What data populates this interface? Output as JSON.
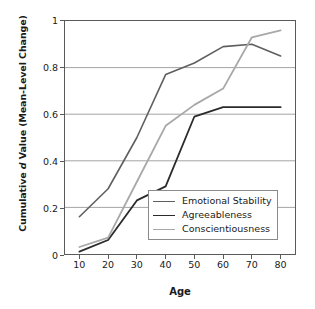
{
  "chart_data": {
    "type": "line",
    "title": "",
    "xlabel": "Age",
    "ylabel": "Cumulative d Value (Mean-Level Change)",
    "ylabel_prefix": "Cumulative ",
    "ylabel_italic": "d",
    "ylabel_suffix": " Value (Mean-Level Change)",
    "x": [
      10,
      20,
      30,
      40,
      50,
      60,
      70,
      80
    ],
    "xlim": [
      5,
      85
    ],
    "ylim": [
      0,
      1
    ],
    "xticks": [
      "10",
      "20",
      "30",
      "40",
      "50",
      "60",
      "70",
      "80"
    ],
    "yticks": [
      "0",
      "0.2",
      "0.4",
      "0.6",
      "0.8",
      "1"
    ],
    "ytick_values": [
      0,
      0.2,
      0.4,
      0.6,
      0.8,
      1
    ],
    "grid": "horizontal",
    "grid_color": "#9a9a9a",
    "legend_position": "lower right",
    "series": [
      {
        "name": "Emotional Stability",
        "color": "#5f5f5f",
        "width": 1.6,
        "values": [
          0.16,
          0.28,
          0.5,
          0.77,
          0.82,
          0.89,
          0.9,
          0.85
        ]
      },
      {
        "name": "Agreeableness",
        "color": "#2b2b2b",
        "width": 1.8,
        "values": [
          0.01,
          0.06,
          0.23,
          0.29,
          0.59,
          0.63,
          0.63,
          0.63
        ]
      },
      {
        "name": "Conscientiousness",
        "color": "#a8a8a8",
        "width": 1.8,
        "values": [
          0.03,
          0.07,
          0.31,
          0.55,
          0.64,
          0.71,
          0.93,
          0.96
        ]
      }
    ]
  }
}
